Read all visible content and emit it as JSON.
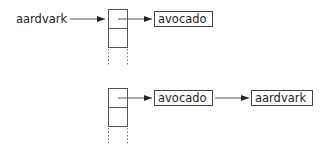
{
  "diagram": {
    "top": {
      "key_label": "aardvark",
      "chain": [
        "avocado"
      ]
    },
    "bottom": {
      "chain": [
        "avocado",
        "aardvark"
      ]
    },
    "colors": {
      "line": "#444444",
      "text": "#222222",
      "background": "#ffffff"
    }
  }
}
